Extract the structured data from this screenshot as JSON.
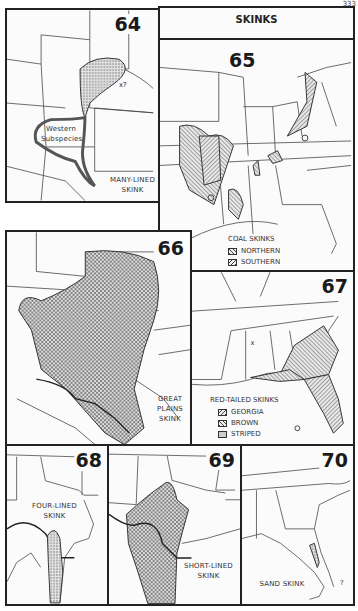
{
  "page": {
    "title": "SKINKS",
    "page_number_fragment": "333"
  },
  "maps": [
    {
      "id": "64",
      "number": "64",
      "species": "MANY-LINED SKINK",
      "labels": [
        "MANY-LINED",
        "SKINK"
      ],
      "annotations": [
        "Western",
        "Subspecies",
        "x?"
      ]
    },
    {
      "id": "65",
      "number": "65",
      "species": "COAL SKINKS",
      "legend_title": "COAL SKINKS",
      "legend": [
        {
          "label": "NORTHERN",
          "pattern": "hatch-right"
        },
        {
          "label": "SOUTHERN",
          "pattern": "hatch-left"
        }
      ]
    },
    {
      "id": "66",
      "number": "66",
      "species": "GREAT PLAINS SKINK",
      "labels": [
        "GREAT",
        "PLAINS",
        "SKINK"
      ]
    },
    {
      "id": "67",
      "number": "67",
      "species": "RED-TAILED SKINKS",
      "legend_title": "RED-TAILED SKINKS",
      "legend": [
        {
          "label": "GEORGIA",
          "pattern": "hatch-left"
        },
        {
          "label": "BROWN",
          "pattern": "hatch-right"
        },
        {
          "label": "STRIPED",
          "pattern": "stipple"
        }
      ],
      "annotations": [
        "x"
      ]
    },
    {
      "id": "68",
      "number": "68",
      "species": "FOUR-LINED SKINK",
      "labels": [
        "FOUR-LINED",
        "SKINK"
      ]
    },
    {
      "id": "69",
      "number": "69",
      "species": "SHORT-LINED SKINK",
      "labels": [
        "SHORT-LINED",
        "SKINK"
      ]
    },
    {
      "id": "70",
      "number": "70",
      "species": "SAND SKINK",
      "labels": [
        "SAND SKINK"
      ],
      "annotations": [
        "?"
      ]
    }
  ]
}
